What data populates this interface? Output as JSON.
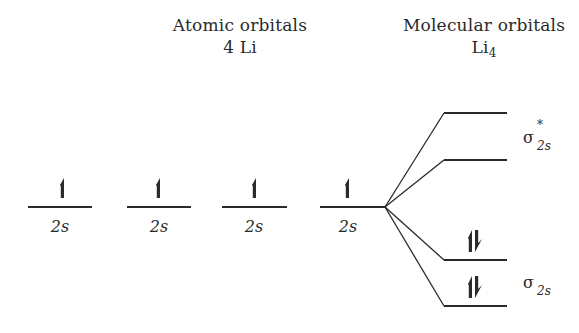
{
  "headers": {
    "atomic": {
      "line1": "Atomic orbitals",
      "line2": "4 Li"
    },
    "molecular": {
      "line1": "Molecular orbitals",
      "line2_base": "Li",
      "line2_sub": "4"
    }
  },
  "atomic_orbitals": [
    {
      "label": "2s",
      "electrons": "up"
    },
    {
      "label": "2s",
      "electrons": "up"
    },
    {
      "label": "2s",
      "electrons": "up"
    },
    {
      "label": "2s",
      "electrons": "up"
    }
  ],
  "molecular_orbitals": [
    {
      "level": 1,
      "electrons": "none"
    },
    {
      "level": 2,
      "electrons": "none"
    },
    {
      "level": 3,
      "electrons": "paired"
    },
    {
      "level": 4,
      "electrons": "paired"
    }
  ],
  "mo_labels": {
    "antibonding": {
      "symbol": "σ",
      "sub": "2s",
      "sup": "*"
    },
    "bonding": {
      "symbol": "σ",
      "sub": "2s"
    }
  },
  "colors": {
    "line": "#2a2a2a",
    "text": "#2a2a2a",
    "background": "#ffffff"
  }
}
